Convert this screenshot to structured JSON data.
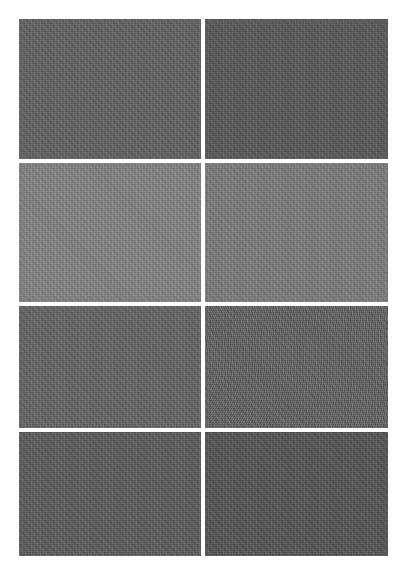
{
  "figure": {
    "background": "#ffffff",
    "layout": {
      "rows": 4,
      "columns": 2
    },
    "panels": [
      {
        "row": 1,
        "col": 1,
        "color": "#646464",
        "pattern": "noise"
      },
      {
        "row": 1,
        "col": 2,
        "color": "#5b5b5b",
        "pattern": "noise"
      },
      {
        "row": 2,
        "col": 1,
        "color": "#858585",
        "pattern": "noise"
      },
      {
        "row": 2,
        "col": 2,
        "color": "#7f7f7f",
        "pattern": "noise"
      },
      {
        "row": 3,
        "col": 1,
        "color": "#666666",
        "pattern": "noise"
      },
      {
        "row": 3,
        "col": 2,
        "color": "#626262",
        "pattern": "arc-moire"
      },
      {
        "row": 4,
        "col": 1,
        "color": "#5e5e5e",
        "pattern": "noise"
      },
      {
        "row": 4,
        "col": 2,
        "color": "#575757",
        "pattern": "noise"
      }
    ]
  }
}
